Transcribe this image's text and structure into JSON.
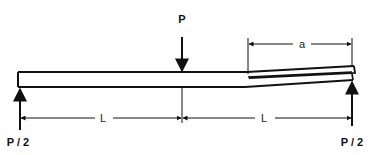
{
  "diagram": {
    "labels": {
      "center_load": "P",
      "left_reaction": "P / 2",
      "right_reaction": "P / 2",
      "crack_length": "a",
      "left_span": "L",
      "right_span": "L"
    },
    "colors": {
      "line": "#111111",
      "background": "#ffffff"
    }
  }
}
